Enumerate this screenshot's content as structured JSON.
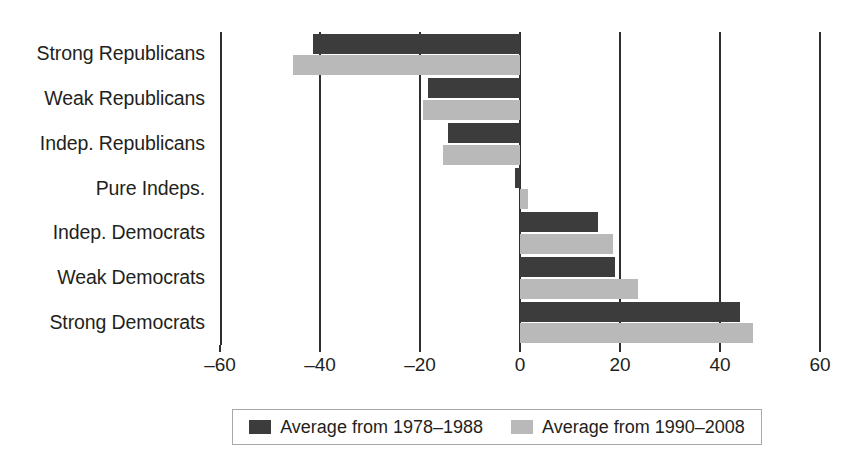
{
  "chart_data": {
    "type": "bar",
    "orientation": "horizontal",
    "title": "",
    "subtitle": "",
    "xlabel": "",
    "ylabel": "",
    "xlim": [
      -60,
      60
    ],
    "xticks": [
      -60,
      -40,
      -20,
      0,
      20,
      40,
      60
    ],
    "xticklabels": [
      "–60",
      "–40",
      "–20",
      "0",
      "20",
      "40",
      "60"
    ],
    "grid": "vertical-gridlines-at-xticks",
    "legend_position": "bottom-center-boxed",
    "categories": [
      "Strong Republicans",
      "Weak Republicans",
      "Indep. Republicans",
      "Pure Indeps.",
      "Indep. Democrats",
      "Weak Democrats",
      "Strong Democrats"
    ],
    "series": [
      {
        "name": "Average from 1978–1988",
        "color": "#3c3c3c",
        "values": [
          -41.5,
          -18.5,
          -14.5,
          -1.0,
          15.5,
          19.0,
          44.0
        ]
      },
      {
        "name": "Average from 1990–2008",
        "color": "#b9b9b9",
        "values": [
          -45.5,
          -19.5,
          -15.5,
          1.5,
          18.5,
          23.5,
          46.5
        ]
      }
    ]
  },
  "legend": {
    "entries": [
      {
        "label": "Average from 1978–1988",
        "swatch": "dark-swatch-icon"
      },
      {
        "label": "Average from 1990–2008",
        "swatch": "light-swatch-icon"
      }
    ]
  },
  "colors": {
    "series_dark": "#3c3c3c",
    "series_light": "#b9b9b9",
    "axis": "#2f2f2f",
    "text": "#231f20",
    "background": "#ffffff",
    "legend_border": "#a8a8a8"
  }
}
